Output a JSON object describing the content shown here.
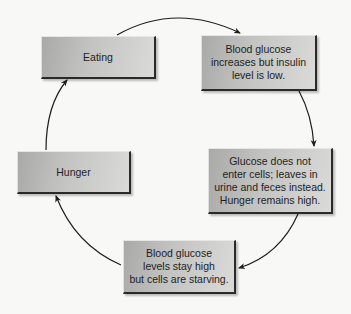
{
  "diagram": {
    "type": "cycle",
    "nodes": [
      {
        "id": "eating",
        "label": "Eating"
      },
      {
        "id": "blood-glucose-increases",
        "label": "Blood glucose\nincreases but insulin\nlevel is low."
      },
      {
        "id": "glucose-not-enter",
        "label": "Glucose does not\nenter cells; leaves in\nurine and feces instead.\nHunger remains high."
      },
      {
        "id": "cells-starving",
        "label": "Blood glucose\nlevels stay high\nbut cells are starving."
      },
      {
        "id": "hunger",
        "label": "Hunger"
      }
    ],
    "edges": [
      {
        "from": "eating",
        "to": "blood-glucose-increases"
      },
      {
        "from": "blood-glucose-increases",
        "to": "glucose-not-enter"
      },
      {
        "from": "glucose-not-enter",
        "to": "cells-starving"
      },
      {
        "from": "cells-starving",
        "to": "hunger"
      },
      {
        "from": "hunger",
        "to": "eating"
      }
    ]
  },
  "colors": {
    "background": "#f8f8f6",
    "box_dark": "#a9a9a7",
    "box_light": "#dadad8",
    "box_shadow": "#2a2a2a",
    "arrow": "#1e1e1e",
    "text": "#1e1e1e"
  }
}
